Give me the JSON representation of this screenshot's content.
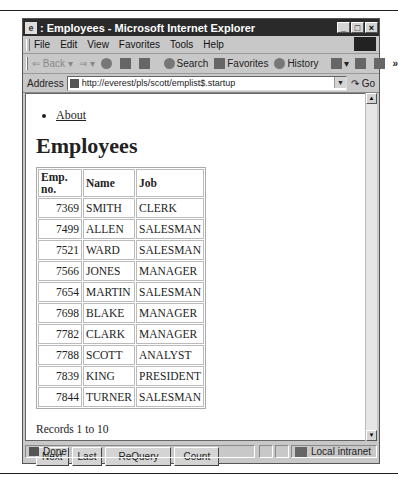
{
  "window": {
    "title": ": Employees - Microsoft Internet Explorer",
    "controls": {
      "minimize": "_",
      "maximize": "□",
      "close": "×"
    }
  },
  "menubar": {
    "items": [
      "File",
      "Edit",
      "View",
      "Favorites",
      "Tools",
      "Help"
    ]
  },
  "toolbar": {
    "back": "⇐ Back",
    "forward": "⇒",
    "search": "Search",
    "favorites": "Favorites",
    "history": "History",
    "more": "»"
  },
  "address": {
    "label": "Address",
    "url": "http://everest/pls/scott/emplist$.startup",
    "go": "Go"
  },
  "page": {
    "nav_links": [
      "About"
    ],
    "heading": "Employees",
    "table": {
      "columns": [
        "Emp. no.",
        "Name",
        "Job"
      ],
      "rows": [
        [
          "7369",
          "SMITH",
          "CLERK"
        ],
        [
          "7499",
          "ALLEN",
          "SALESMAN"
        ],
        [
          "7521",
          "WARD",
          "SALESMAN"
        ],
        [
          "7566",
          "JONES",
          "MANAGER"
        ],
        [
          "7654",
          "MARTIN",
          "SALESMAN"
        ],
        [
          "7698",
          "BLAKE",
          "MANAGER"
        ],
        [
          "7782",
          "CLARK",
          "MANAGER"
        ],
        [
          "7788",
          "SCOTT",
          "ANALYST"
        ],
        [
          "7839",
          "KING",
          "PRESIDENT"
        ],
        [
          "7844",
          "TURNER",
          "SALESMAN"
        ]
      ]
    },
    "records_text": "Records 1 to 10",
    "buttons": {
      "next": "Next",
      "last": "Last",
      "requery": "ReQuery",
      "count": "Count"
    }
  },
  "statusbar": {
    "status": "Done",
    "zone": "Local intranet"
  }
}
